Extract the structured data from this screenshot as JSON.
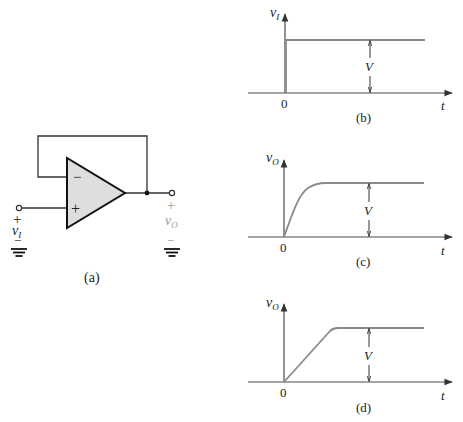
{
  "circuit": {
    "caption": "(a)",
    "input_label": "v",
    "input_sub": "I",
    "output_label": "v",
    "output_sub": "O",
    "plus_sign": "+",
    "minus_sign": "−",
    "opamp_minus": "−",
    "opamp_plus": "+",
    "colors": {
      "wire": "#333333",
      "opamp_fill": "#dedede",
      "opamp_stroke": "#111111",
      "output_label": "#9a9a9a"
    }
  },
  "graphs": [
    {
      "caption": "(b)",
      "y_label": "v",
      "y_sub": "I",
      "x_label": "t",
      "origin_label": "0",
      "amplitude_label": "V",
      "waveform": "step"
    },
    {
      "caption": "(c)",
      "y_label": "v",
      "y_sub": "O",
      "x_label": "t",
      "origin_label": "0",
      "amplitude_label": "V",
      "waveform": "exponential-rise"
    },
    {
      "caption": "(d)",
      "y_label": "v",
      "y_sub": "O",
      "x_label": "t",
      "origin_label": "0",
      "amplitude_label": "V",
      "waveform": "slew-rate-ramp"
    }
  ],
  "colors": {
    "axis": "#4a4a4a",
    "waveform": "#8a8a8a",
    "text": "#222222"
  }
}
